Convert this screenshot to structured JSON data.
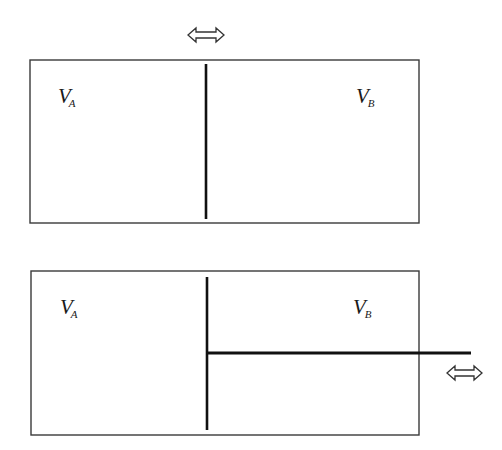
{
  "diagram": {
    "type": "piston-cylinder-schematic",
    "colors": {
      "stroke": "#1a1a1a",
      "box_stroke": "#333333",
      "background": "#ffffff"
    },
    "panels": [
      {
        "id": "top",
        "description": "Cylinder divided by movable partition (piston without rod)",
        "left_label": {
          "main": "V",
          "sub": "A"
        },
        "right_label": {
          "main": "V",
          "sub": "B"
        },
        "arrow": "double-headed horizontal arrow above partition",
        "has_rod": false
      },
      {
        "id": "bottom",
        "description": "Cylinder divided by piston with rod extending through right wall",
        "left_label": {
          "main": "V",
          "sub": "A"
        },
        "right_label": {
          "main": "V",
          "sub": "B"
        },
        "arrow": "double-headed horizontal arrow right of rod",
        "has_rod": true
      }
    ]
  }
}
